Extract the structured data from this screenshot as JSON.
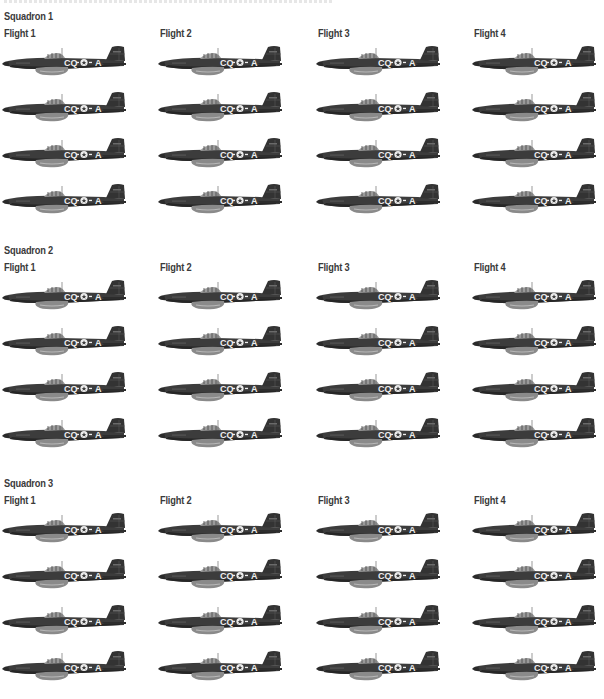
{
  "page": {
    "top_caption": "",
    "aircraft_code": {
      "left": "CQ",
      "insignia": "star",
      "right": "A"
    },
    "colors": {
      "fuselage": "#3c3c3c",
      "fuselage_dark": "#262626",
      "underside": "#8a8a8a",
      "scoop": "#b8b8b8",
      "markings": "#eeeeee",
      "text": "#3a3a3a"
    }
  },
  "squadrons": [
    {
      "label": "Squadron 1",
      "flights": [
        {
          "label": "Flight 1",
          "aircraft_count": 4
        },
        {
          "label": "Flight 2",
          "aircraft_count": 4
        },
        {
          "label": "Flight 3",
          "aircraft_count": 4
        },
        {
          "label": "Flight 4",
          "aircraft_count": 4
        }
      ]
    },
    {
      "label": "Squadron 2",
      "flights": [
        {
          "label": "Flight 1",
          "aircraft_count": 4
        },
        {
          "label": "Flight 2",
          "aircraft_count": 4
        },
        {
          "label": "Flight 3",
          "aircraft_count": 4
        },
        {
          "label": "Flight 4",
          "aircraft_count": 4
        }
      ]
    },
    {
      "label": "Squadron 3",
      "flights": [
        {
          "label": "Flight 1",
          "aircraft_count": 4
        },
        {
          "label": "Flight 2",
          "aircraft_count": 4
        },
        {
          "label": "Flight 3",
          "aircraft_count": 4
        },
        {
          "label": "Flight 4",
          "aircraft_count": 4
        }
      ]
    }
  ]
}
